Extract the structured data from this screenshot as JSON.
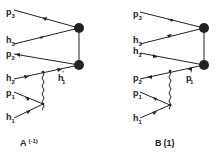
{
  "diagrams": [
    {
      "id": "A",
      "caption": "A",
      "caption_arg": "(-1)",
      "labels": {
        "p3": {
          "main": "p",
          "sub": "3"
        },
        "h3": {
          "main": "h",
          "sub": "3"
        },
        "p2": {
          "main": "p",
          "sub": "2"
        },
        "h2": {
          "main": "h",
          "sub": "2"
        },
        "p1": {
          "main": "p",
          "sub": "1"
        },
        "h1": {
          "main": "h",
          "sub": "1"
        },
        "inner": {
          "main": "h",
          "sub": "1",
          "prime": "'"
        }
      }
    },
    {
      "id": "B",
      "caption": "B",
      "caption_arg": "(1)",
      "labels": {
        "p3": {
          "main": "p",
          "sub": "3"
        },
        "h3": {
          "main": "h",
          "sub": "3"
        },
        "h2": {
          "main": "h",
          "sub": "2"
        },
        "p2": {
          "main": "p",
          "sub": "2"
        },
        "p1": {
          "main": "p",
          "sub": "1"
        },
        "h1": {
          "main": "h",
          "sub": "1"
        },
        "inner": {
          "main": "p",
          "sub": "1",
          "prime": "'"
        }
      }
    }
  ]
}
